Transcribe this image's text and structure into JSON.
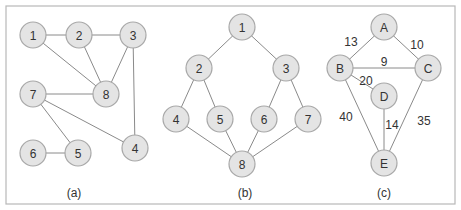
{
  "figure": {
    "node_radius": 13,
    "colors": {
      "node_fill": "#e4e4e4",
      "node_stroke": "#a8a8a8",
      "edge": "#8a8a8a",
      "text": "#333333",
      "frame": "#b8b8b8"
    },
    "frame": {
      "x": 6,
      "y": 6,
      "width": 449,
      "height": 198
    }
  },
  "panels": [
    {
      "id": "a",
      "caption": "(a)",
      "caption_pos": {
        "x": 74,
        "y": 193
      },
      "weighted": false,
      "nodes": [
        {
          "id": "1",
          "label": "1",
          "x": 33,
          "y": 35
        },
        {
          "id": "2",
          "label": "2",
          "x": 79,
          "y": 35
        },
        {
          "id": "3",
          "label": "3",
          "x": 133,
          "y": 35
        },
        {
          "id": "7",
          "label": "7",
          "x": 33,
          "y": 94
        },
        {
          "id": "8",
          "label": "8",
          "x": 106,
          "y": 94
        },
        {
          "id": "6",
          "label": "6",
          "x": 33,
          "y": 153
        },
        {
          "id": "5",
          "label": "5",
          "x": 78,
          "y": 153
        },
        {
          "id": "4",
          "label": "4",
          "x": 135,
          "y": 148
        }
      ],
      "edges": [
        {
          "from": "1",
          "to": "2"
        },
        {
          "from": "2",
          "to": "3"
        },
        {
          "from": "1",
          "to": "8"
        },
        {
          "from": "2",
          "to": "8"
        },
        {
          "from": "3",
          "to": "8"
        },
        {
          "from": "3",
          "to": "4"
        },
        {
          "from": "7",
          "to": "8"
        },
        {
          "from": "7",
          "to": "4"
        },
        {
          "from": "7",
          "to": "5"
        },
        {
          "from": "6",
          "to": "5"
        }
      ]
    },
    {
      "id": "b",
      "caption": "(b)",
      "caption_pos": {
        "x": 245,
        "y": 193
      },
      "weighted": false,
      "nodes": [
        {
          "id": "1",
          "label": "1",
          "x": 242,
          "y": 27
        },
        {
          "id": "2",
          "label": "2",
          "x": 199,
          "y": 68
        },
        {
          "id": "3",
          "label": "3",
          "x": 286,
          "y": 68
        },
        {
          "id": "4",
          "label": "4",
          "x": 176,
          "y": 119
        },
        {
          "id": "5",
          "label": "5",
          "x": 220,
          "y": 119
        },
        {
          "id": "6",
          "label": "6",
          "x": 264,
          "y": 119
        },
        {
          "id": "7",
          "label": "7",
          "x": 308,
          "y": 119
        },
        {
          "id": "8",
          "label": "8",
          "x": 242,
          "y": 164
        }
      ],
      "edges": [
        {
          "from": "1",
          "to": "2"
        },
        {
          "from": "1",
          "to": "3"
        },
        {
          "from": "2",
          "to": "4"
        },
        {
          "from": "2",
          "to": "5"
        },
        {
          "from": "3",
          "to": "6"
        },
        {
          "from": "3",
          "to": "7"
        },
        {
          "from": "4",
          "to": "8"
        },
        {
          "from": "5",
          "to": "8"
        },
        {
          "from": "6",
          "to": "8"
        },
        {
          "from": "7",
          "to": "8"
        }
      ]
    },
    {
      "id": "c",
      "caption": "(c)",
      "caption_pos": {
        "x": 384,
        "y": 193
      },
      "weighted": true,
      "nodes": [
        {
          "id": "A",
          "label": "A",
          "x": 384,
          "y": 27
        },
        {
          "id": "B",
          "label": "B",
          "x": 340,
          "y": 68
        },
        {
          "id": "C",
          "label": "C",
          "x": 428,
          "y": 68
        },
        {
          "id": "D",
          "label": "D",
          "x": 384,
          "y": 96
        },
        {
          "id": "E",
          "label": "E",
          "x": 384,
          "y": 163
        }
      ],
      "edges": [
        {
          "from": "A",
          "to": "B",
          "weight": "13",
          "label_x": 351,
          "label_y": 42
        },
        {
          "from": "A",
          "to": "C",
          "weight": "10",
          "label_x": 417,
          "label_y": 45
        },
        {
          "from": "B",
          "to": "C",
          "weight": "9",
          "label_x": 384,
          "label_y": 62
        },
        {
          "from": "B",
          "to": "D",
          "weight": "20",
          "label_x": 366,
          "label_y": 81
        },
        {
          "from": "B",
          "to": "E",
          "weight": "40",
          "label_x": 346,
          "label_y": 117
        },
        {
          "from": "D",
          "to": "E",
          "weight": "14",
          "label_x": 392,
          "label_y": 125
        },
        {
          "from": "C",
          "to": "E",
          "weight": "35",
          "label_x": 424,
          "label_y": 121
        }
      ]
    }
  ]
}
